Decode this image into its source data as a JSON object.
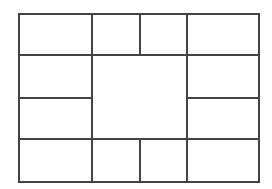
{
  "diagram": {
    "type": "grid-layout",
    "line_color": "#444444",
    "background": "#ffffff",
    "cells": [
      {
        "name": "cell-top-1",
        "x": 18,
        "y": 13,
        "w": 75,
        "h": 43
      },
      {
        "name": "cell-top-2",
        "x": 91,
        "y": 13,
        "w": 50,
        "h": 43
      },
      {
        "name": "cell-top-3",
        "x": 139,
        "y": 13,
        "w": 49,
        "h": 43
      },
      {
        "name": "cell-top-4",
        "x": 186,
        "y": 13,
        "w": 74,
        "h": 43
      },
      {
        "name": "cell-left-upper",
        "x": 18,
        "y": 54,
        "w": 75,
        "h": 45
      },
      {
        "name": "cell-center",
        "x": 91,
        "y": 54,
        "w": 97,
        "h": 86
      },
      {
        "name": "cell-right-upper",
        "x": 186,
        "y": 54,
        "w": 74,
        "h": 45
      },
      {
        "name": "cell-left-lower",
        "x": 18,
        "y": 97,
        "w": 75,
        "h": 43
      },
      {
        "name": "cell-right-lower",
        "x": 186,
        "y": 97,
        "w": 74,
        "h": 43
      },
      {
        "name": "cell-bottom-1",
        "x": 18,
        "y": 138,
        "w": 75,
        "h": 45
      },
      {
        "name": "cell-bottom-2",
        "x": 91,
        "y": 138,
        "w": 50,
        "h": 45
      },
      {
        "name": "cell-bottom-3",
        "x": 139,
        "y": 138,
        "w": 49,
        "h": 45
      },
      {
        "name": "cell-bottom-4",
        "x": 186,
        "y": 138,
        "w": 74,
        "h": 45
      }
    ]
  }
}
